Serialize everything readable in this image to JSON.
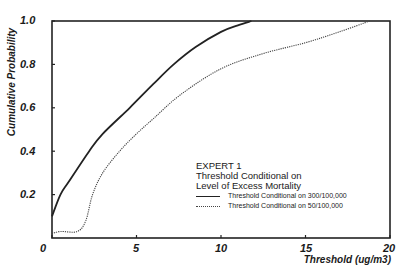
{
  "chart_data": {
    "type": "line",
    "title": "",
    "xlabel": "Threshold (ug/m3)",
    "ylabel": "Cumulative Probability",
    "xlim": [
      0,
      20
    ],
    "ylim": [
      0,
      1.0
    ],
    "x_ticks": [
      "0",
      "5",
      "10",
      "15",
      "20"
    ],
    "y_ticks": [
      "0.2",
      "0.4",
      "0.6",
      "0.8",
      "1.0"
    ],
    "grid": false,
    "legend_position": "lower right",
    "legend_title": [
      "EXPERT 1",
      "Threshold Conditional on",
      "Level of Excess Mortality"
    ],
    "series": [
      {
        "name": "Threshold Conditional on 300/100,000",
        "style": "solid",
        "x": [
          0,
          0.5,
          1,
          2.2,
          3,
          4.6,
          6,
          7.2,
          8.5,
          10,
          11,
          11.8
        ],
        "y": [
          0.1,
          0.2,
          0.26,
          0.4,
          0.48,
          0.6,
          0.71,
          0.8,
          0.88,
          0.95,
          0.98,
          1.0
        ]
      },
      {
        "name": "Threshold Conditional on 50/100,000",
        "style": "dotted",
        "x": [
          0,
          0.5,
          1.5,
          2.0,
          2.4,
          3.0,
          4.0,
          5.0,
          6.0,
          7.6,
          10,
          12.5,
          15,
          17,
          18.8
        ],
        "y": [
          0.02,
          0.03,
          0.03,
          0.08,
          0.2,
          0.3,
          0.4,
          0.48,
          0.55,
          0.66,
          0.78,
          0.85,
          0.9,
          0.95,
          1.0
        ]
      }
    ]
  },
  "labels": {
    "ylabel": "Cumulative Probability",
    "xlabel": "Threshold (ug/m3)",
    "legend_title_1": "EXPERT 1",
    "legend_title_2": "Threshold Conditional on",
    "legend_title_3": "Level of Excess Mortality",
    "legend_series_1": "Threshold Conditional on 300/100,000",
    "legend_series_2": "Threshold Conditional on 50/100,000"
  },
  "ticks": {
    "x": [
      "0",
      "5",
      "10",
      "15",
      "20"
    ],
    "y": [
      "0.2",
      "0.4",
      "0.6",
      "0.8",
      "1.0"
    ]
  }
}
